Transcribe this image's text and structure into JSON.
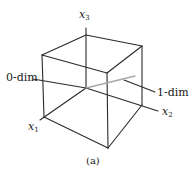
{
  "figure": {
    "caption": "(a)",
    "axes": {
      "x1": {
        "var": "x",
        "sub": "1"
      },
      "x2": {
        "var": "x",
        "sub": "2"
      },
      "x3": {
        "var": "x",
        "sub": "3"
      }
    },
    "annotations": {
      "zero_dim": "0-dim",
      "one_dim": "1-dim"
    },
    "colors": {
      "edge": "#2a2a2a",
      "one_dim_line": "#a8a8a8"
    }
  }
}
